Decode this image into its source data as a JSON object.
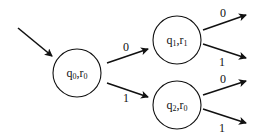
{
  "diagram": {
    "type": "state-transition",
    "states": [
      {
        "id": "s0",
        "q": "q",
        "q_sub": "0",
        "r": "r",
        "r_sub": "0",
        "cx": 77,
        "cy": 73,
        "r_px": 24,
        "initial": true
      },
      {
        "id": "s1",
        "q": "q",
        "q_sub": "1",
        "r": "r",
        "r_sub": "1",
        "cx": 177,
        "cy": 40,
        "r_px": 24
      },
      {
        "id": "s2",
        "q": "q",
        "q_sub": "2",
        "r": "r",
        "r_sub": "0",
        "cx": 177,
        "cy": 105,
        "r_px": 24
      }
    ],
    "transitions": [
      {
        "from": "s0",
        "to": "s1",
        "label": "0"
      },
      {
        "from": "s0",
        "to": "s2",
        "label": "1"
      },
      {
        "from": "s1",
        "to": "out",
        "label": "0"
      },
      {
        "from": "s1",
        "to": "out",
        "label": "1"
      },
      {
        "from": "s2",
        "to": "out",
        "label": "0"
      },
      {
        "from": "s2",
        "to": "out",
        "label": "1"
      }
    ],
    "labels": {
      "e_s0_s1": "0",
      "e_s0_s2": "1",
      "e_s1_a": "0",
      "e_s1_b": "1",
      "e_s2_a": "0",
      "e_s2_b": "1"
    },
    "stroke_color": "#111111"
  }
}
